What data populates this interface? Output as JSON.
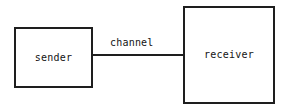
{
  "diagram": {
    "canvas": {
      "width": 286,
      "height": 110,
      "background": "#ffffff"
    },
    "stroke_color": "#1e1e1e",
    "text_color": "#141414",
    "nodes": [
      {
        "id": "sender",
        "label": "sender",
        "shape": "rectangle",
        "x": 14,
        "y": 27,
        "width": 79,
        "height": 61
      },
      {
        "id": "receiver",
        "label": "receiver",
        "shape": "rectangle",
        "x": 183,
        "y": 6,
        "width": 92,
        "height": 98
      }
    ],
    "edges": [
      {
        "id": "channel",
        "label": "channel",
        "from": "sender",
        "to": "receiver",
        "style": "solid-line",
        "arrowheads": "none",
        "x1": 93,
        "y1": 55,
        "x2": 183,
        "y2": 55
      }
    ]
  }
}
